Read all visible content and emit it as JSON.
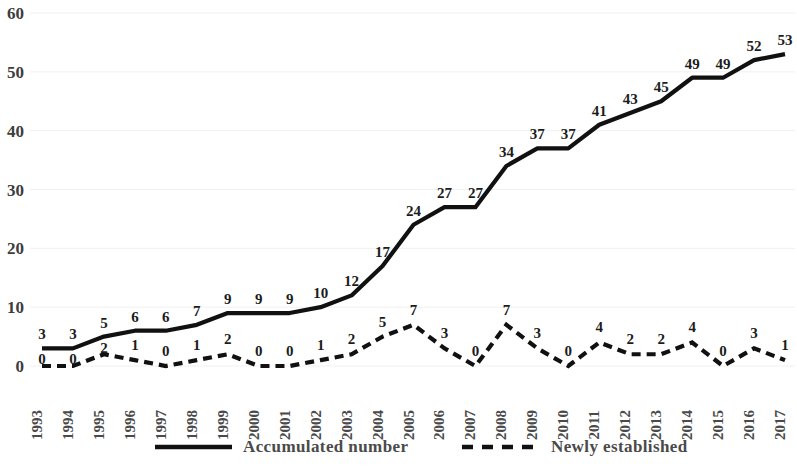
{
  "chart_data": {
    "type": "line",
    "title": "",
    "subtitle": "",
    "xlabel": "",
    "ylabel": "",
    "ylim": [
      0,
      60
    ],
    "yticks": [
      0,
      10,
      20,
      30,
      40,
      50,
      60
    ],
    "grid": true,
    "legend_position": "bottom",
    "categories": [
      "1993",
      "1994",
      "1995",
      "1996",
      "1997",
      "1998",
      "1999",
      "2000",
      "2001",
      "2002",
      "2003",
      "2004",
      "2005",
      "2006",
      "2007",
      "2008",
      "2009",
      "2010",
      "2011",
      "2012",
      "2013",
      "2014",
      "2015",
      "2016",
      "2017"
    ],
    "series": [
      {
        "name": "Accumulated number",
        "style": "solid",
        "color": "#111111",
        "values": [
          3,
          3,
          5,
          6,
          6,
          7,
          9,
          9,
          9,
          10,
          12,
          17,
          24,
          27,
          27,
          34,
          37,
          37,
          41,
          43,
          45,
          49,
          49,
          52,
          53
        ]
      },
      {
        "name": "Newly established",
        "style": "dashed",
        "color": "#111111",
        "values": [
          0,
          0,
          2,
          1,
          0,
          1,
          2,
          0,
          0,
          1,
          2,
          5,
          7,
          3,
          0,
          7,
          3,
          0,
          4,
          2,
          2,
          4,
          0,
          3,
          1
        ]
      }
    ]
  },
  "legend": {
    "items": [
      {
        "label": "Accumulated number",
        "style": "solid"
      },
      {
        "label": "Newly established",
        "style": "dashed"
      }
    ]
  },
  "colors": {
    "line": "#111111",
    "grid": "#f0f0f0",
    "tick_text": "#4a4a4a",
    "data_label_text": "#1c1c1c",
    "background": "#ffffff"
  }
}
